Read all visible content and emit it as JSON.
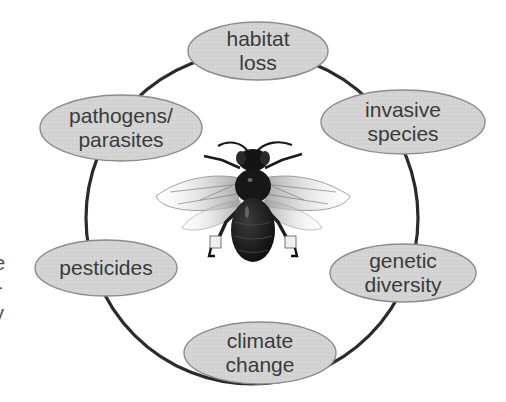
{
  "diagram": {
    "title": "",
    "center": {
      "label": "bee",
      "description": "illustration of a bee viewed from above, wings spread"
    },
    "ring": {
      "cx": 252,
      "cy": 218,
      "r": 166,
      "stroke": "#2b2b2b"
    },
    "node_style": {
      "fill": "#d3d3d3",
      "stroke": "#8c8c8c",
      "text_color": "#3a3a3a"
    },
    "nodes": [
      {
        "id": "habitat-loss",
        "lines": [
          "habitat",
          "loss"
        ],
        "cx": 258,
        "cy": 51,
        "rx": 70,
        "ry": 29
      },
      {
        "id": "invasive-species",
        "lines": [
          "invasive",
          "species"
        ],
        "cx": 403,
        "cy": 122,
        "rx": 82,
        "ry": 32
      },
      {
        "id": "genetic-diversity",
        "lines": [
          "genetic",
          "diversity"
        ],
        "cx": 403,
        "cy": 273,
        "rx": 73,
        "ry": 29
      },
      {
        "id": "climate-change",
        "lines": [
          "climate",
          "change"
        ],
        "cx": 260,
        "cy": 353,
        "rx": 76,
        "ry": 31
      },
      {
        "id": "pesticides",
        "lines": [
          "pesticides"
        ],
        "cx": 106,
        "cy": 268,
        "rx": 71,
        "ry": 28
      },
      {
        "id": "pathogens-parasites",
        "lines": [
          "pathogens/",
          "parasites"
        ],
        "cx": 121,
        "cy": 128,
        "rx": 81,
        "ry": 33
      }
    ],
    "edge_fragments": [
      "e",
      "-",
      "y"
    ]
  }
}
